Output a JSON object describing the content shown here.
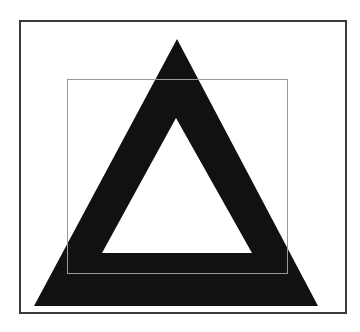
{
  "figure": {
    "colors": {
      "background": "#ffffff",
      "frame": "#3a3a3a",
      "triangle": "#111111",
      "inner_rect": "#9a9a9a"
    },
    "frame": {
      "x": 20,
      "y": 21,
      "width": 326,
      "height": 292
    },
    "inner_rect": {
      "x": 67,
      "y": 79,
      "width": 220,
      "height": 194
    },
    "outer_triangle": {
      "apex": [
        177,
        39
      ],
      "left": [
        34,
        306
      ],
      "right": [
        318,
        306
      ]
    },
    "inner_triangle": {
      "apex": [
        176,
        118
      ],
      "left": [
        102,
        253
      ],
      "right": [
        252,
        253
      ]
    }
  }
}
